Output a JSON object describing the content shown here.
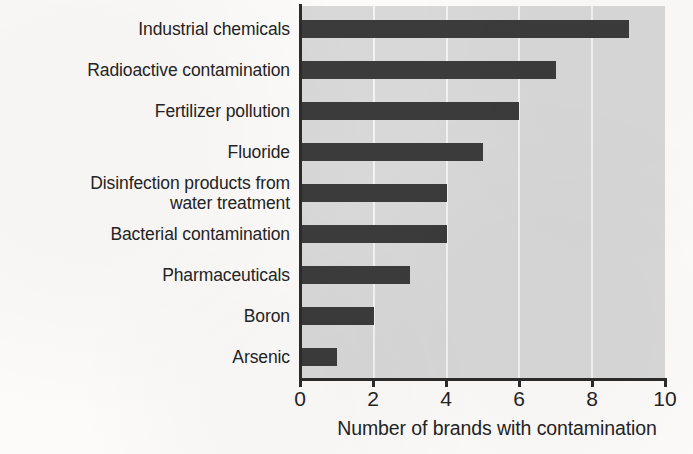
{
  "chart_data": {
    "type": "bar",
    "orientation": "horizontal",
    "title": "",
    "subtitle": "",
    "xlabel": "Number of brands with contamination",
    "ylabel": "",
    "xlim": [
      0,
      10
    ],
    "xticks": [
      "0",
      "2",
      "4",
      "6",
      "8",
      "10"
    ],
    "xtick_values": [
      0,
      2,
      4,
      6,
      8,
      10
    ],
    "grid": "vertical gridlines at each x tick",
    "legend": "none",
    "categories": [
      "Industrial chemicals",
      "Radioactive contamination",
      "Fertilizer pollution",
      "Fluoride",
      "Disinfection products from\nwater treatment",
      "Bacterial contamination",
      "Pharmaceuticals",
      "Boron",
      "Arsenic"
    ],
    "values": [
      9,
      7,
      6,
      5,
      4,
      4,
      3,
      2,
      1
    ],
    "series": [
      {
        "name": "Number of brands with contamination",
        "values": [
          9,
          7,
          6,
          5,
          4,
          4,
          3,
          2,
          1
        ]
      }
    ],
    "colors": {
      "bar": "#3b3b3b",
      "plot_background": "#d8d8d8",
      "gridline": "#f2f2f2",
      "axis": "#2b2b2b",
      "text": "#242424",
      "page_background": "#fcfbfa"
    }
  }
}
